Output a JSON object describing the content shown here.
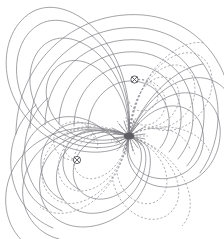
{
  "figure": {
    "background_color": "#ffffff",
    "width": 224,
    "height": 239
  },
  "style": {
    "flux_line_color": "#7d7d82",
    "potential_line_color": "#8d8d93",
    "conductor_color": "#4a4a50",
    "saddle_color": "#5d5d63",
    "flux_line_width": 0.7,
    "potential_line_width": 0.7,
    "potential_dash_pattern": "2.1 1.9"
  },
  "chart_data": {
    "type": "line",
    "subtitle": "",
    "xlabel": "",
    "ylabel": "",
    "xlim": [
      0,
      224
    ],
    "ylim": [
      0,
      239
    ],
    "grid": false,
    "legend_position": "none",
    "tick_labels": {
      "x": [],
      "y": []
    },
    "annotations": [],
    "conductors": [
      {
        "name": "conductor-upper-right",
        "symbol": "circled-cross",
        "direction": "into-page",
        "x": 134.5,
        "y": 79.5,
        "radius": 3.6
      },
      {
        "name": "conductor-lower-left",
        "symbol": "circled-cross",
        "direction": "into-page",
        "x": 77.0,
        "y": 160.0,
        "radius": 3.6
      }
    ],
    "saddle_point": {
      "name": "neutral-point",
      "x": 129.0,
      "y": 136.0
    },
    "series": [
      {
        "name": "flux-lines",
        "style": "solid",
        "color": "#7d7d82",
        "description": "Closed magnetic flux contours encircling each conductor and the pair",
        "count": 18
      },
      {
        "name": "equipotential-lines",
        "style": "dashed",
        "color": "#8d8d93",
        "description": "Dashed scalar-potential contours orthogonal to the flux lines",
        "count": 16
      }
    ]
  }
}
